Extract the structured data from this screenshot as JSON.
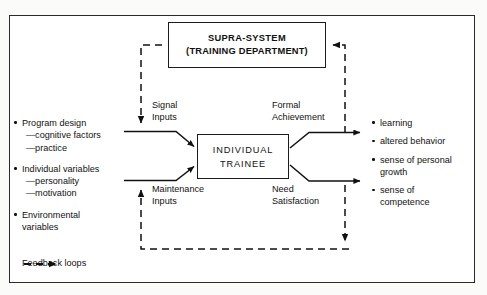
{
  "diagram": {
    "title_nodes": {
      "supra_system": {
        "line1": "SUPRA-SYSTEM",
        "line2": "(TRAINING DEPARTMENT)"
      },
      "individual_trainee": {
        "line1": "INDIVIDUAL",
        "line2": "TRAINEE"
      }
    },
    "flow_labels": {
      "signal_inputs": "Signal\nInputs",
      "maintenance_inputs": "Maintenance\nInputs",
      "formal_achievement": "Formal\nAchievement",
      "need_satisfaction": "Need\nSatisfaction"
    },
    "inputs": [
      {
        "text": "Program design",
        "subs": [
          "—cognitive factors",
          "—practice"
        ]
      },
      {
        "text": "Individual variables",
        "subs": [
          "—personality",
          "—motivation"
        ]
      },
      {
        "text": "Environmental\nvariables",
        "subs": []
      }
    ],
    "outputs": [
      {
        "text": "learning",
        "subs": []
      },
      {
        "text": "altered behavior",
        "subs": []
      },
      {
        "text": "sense of personal\ngrowth",
        "subs": []
      },
      {
        "text": "sense of\ncompetence",
        "subs": []
      }
    ],
    "legend": {
      "label": "Feedback loops",
      "line_style": "dashed-arrow"
    },
    "colors": {
      "ink": "#111111",
      "frame": "#2b2b2b",
      "paper": "#ffffff"
    }
  }
}
